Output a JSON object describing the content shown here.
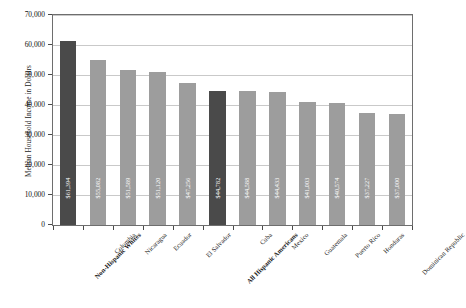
{
  "chart_data": {
    "type": "bar",
    "title": "",
    "xlabel": "",
    "ylabel": "Median Household Income in Dollars",
    "ylim": [
      0,
      70000
    ],
    "ytick_values": [
      0,
      10000,
      20000,
      30000,
      40000,
      50000,
      60000,
      70000
    ],
    "ytick_labels": [
      "0",
      "10,000",
      "20,000",
      "30,000",
      "40,000",
      "50,000",
      "60,000",
      "70,000"
    ],
    "grid": true,
    "legend": "none",
    "categories": [
      "Non-Hispanic Whites",
      "Colombia",
      "Nicaragua",
      "Ecuador",
      "El Salvador",
      "All Hispanic Americans",
      "Cuba",
      "Mexico",
      "Guatemala",
      "Puerto Rico",
      "Honduras",
      "Dominican Republic"
    ],
    "values": [
      61394,
      55082,
      51589,
      51120,
      47256,
      44782,
      44588,
      44433,
      41003,
      40574,
      37227,
      37000
    ],
    "value_labels": [
      "$61,394",
      "$55,082",
      "$51,589",
      "$51,120",
      "$47,256",
      "$44,782",
      "$44,588",
      "$44,433",
      "$41,003",
      "$40,574",
      "$37,227",
      "$37,000"
    ],
    "highlighted": [
      true,
      false,
      false,
      false,
      false,
      true,
      false,
      false,
      false,
      false,
      false,
      false
    ],
    "colors": {
      "bar": "#9d9d9d",
      "bar_highlight": "#4a4a4a",
      "grid": "#c9c9c9",
      "frame": "#6e6e6e",
      "text": "#1a1a1a",
      "value_label": "#ffffff",
      "background": "#ffffff"
    }
  }
}
